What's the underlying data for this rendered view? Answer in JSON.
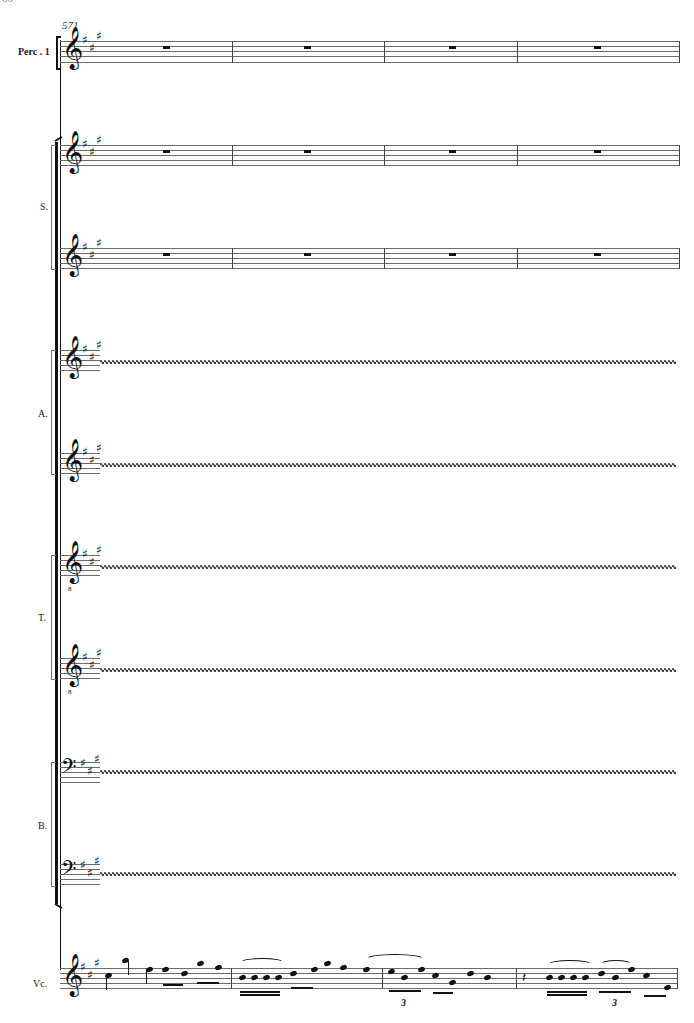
{
  "page": {
    "page_number": "60"
  },
  "score": {
    "measure_start": "571",
    "key_signature": "A major (3 sharps)",
    "staves": [
      {
        "id": "perc1",
        "label": "Perc . 1",
        "clef": "treble",
        "content": "whole rests",
        "measures": 4
      },
      {
        "id": "s1",
        "group": "S.",
        "clef": "treble",
        "content": "whole rests",
        "measures": 4
      },
      {
        "id": "s2",
        "group": "S.",
        "clef": "treble",
        "content": "whole rests",
        "measures": 4
      },
      {
        "id": "a1",
        "group": "A.",
        "clef": "treble",
        "content": "collapsed (wavy line)"
      },
      {
        "id": "a2",
        "group": "A.",
        "clef": "treble",
        "content": "collapsed (wavy line)"
      },
      {
        "id": "t1",
        "group": "T.",
        "clef": "treble-8vb",
        "content": "collapsed (wavy line)"
      },
      {
        "id": "t2",
        "group": "T.",
        "clef": "treble-8vb",
        "content": "collapsed (wavy line)"
      },
      {
        "id": "b1",
        "group": "B.",
        "clef": "bass",
        "content": "collapsed (wavy line)"
      },
      {
        "id": "b2",
        "group": "B.",
        "clef": "bass",
        "content": "collapsed (wavy line)"
      },
      {
        "id": "vc",
        "label": "Vc.",
        "clef": "treble",
        "content": "melodic line with sixteenths, slurs, tenuto/staccato marks, triplets",
        "measures": 4
      }
    ],
    "labels": {
      "perc": "Perc . 1",
      "soprano": "S.",
      "alto": "A.",
      "tenor": "T.",
      "bass": "B.",
      "cello": "Vc."
    },
    "tuplets": [
      "3",
      "3"
    ],
    "glyphs": {
      "treble_clef": "𝄞",
      "bass_clef": "𝄢",
      "sharp": "♯"
    }
  }
}
